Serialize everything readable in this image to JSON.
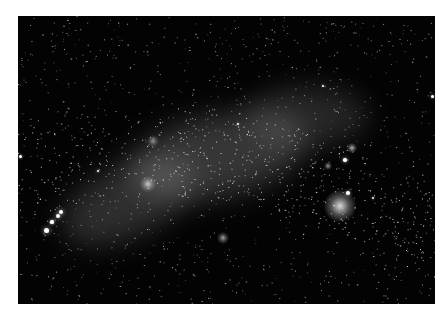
{
  "image": {
    "subject": "galaxy-star-field",
    "background_color": "#030303",
    "frame": {
      "x": 18,
      "y": 16,
      "width": 417,
      "height": 288
    },
    "bands": [
      {
        "x": 40,
        "y": 150,
        "w": 140,
        "h": 70,
        "opacity": 0.22,
        "rot": -25
      },
      {
        "x": 110,
        "y": 100,
        "w": 180,
        "h": 80,
        "opacity": 0.26,
        "rot": -12
      },
      {
        "x": 230,
        "y": 70,
        "w": 120,
        "h": 60,
        "opacity": 0.18,
        "rot": 0
      }
    ],
    "nebulae": [
      {
        "x": 322,
        "y": 190,
        "r": 16,
        "opacity": 0.85
      },
      {
        "x": 130,
        "y": 168,
        "r": 8,
        "opacity": 0.7
      },
      {
        "x": 205,
        "y": 222,
        "r": 6,
        "opacity": 0.6
      },
      {
        "x": 334,
        "y": 132,
        "r": 5,
        "opacity": 0.7
      },
      {
        "x": 310,
        "y": 150,
        "r": 4,
        "opacity": 0.6
      },
      {
        "x": 135,
        "y": 125,
        "r": 6,
        "opacity": 0.5
      }
    ],
    "bright_stars": [
      {
        "x": 28,
        "y": 214,
        "r": 2.5
      },
      {
        "x": 40,
        "y": 200,
        "r": 2.2
      },
      {
        "x": 43,
        "y": 196,
        "r": 2
      },
      {
        "x": 34,
        "y": 206,
        "r": 1.6
      },
      {
        "x": 330,
        "y": 177,
        "r": 1.8
      },
      {
        "x": 327,
        "y": 144,
        "r": 1.8
      },
      {
        "x": 355,
        "y": 182,
        "r": 1.4
      },
      {
        "x": 80,
        "y": 155,
        "r": 1.4
      },
      {
        "x": 414,
        "y": 80,
        "r": 1.5
      },
      {
        "x": 2,
        "y": 140,
        "r": 1.5
      },
      {
        "x": 305,
        "y": 70,
        "r": 1.2
      },
      {
        "x": 220,
        "y": 108,
        "r": 1.2
      }
    ],
    "random_star_count": 2600,
    "seed": 17
  }
}
